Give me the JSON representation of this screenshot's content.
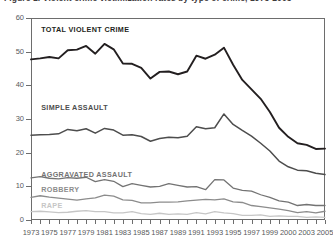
{
  "chart_data": {
    "type": "line",
    "title": "Figure 1. Violent crime victimization rates by type of crime, 1973-2005",
    "xlabel": "",
    "ylabel": "",
    "ylim": [
      0,
      60
    ],
    "yticks": [
      0,
      10,
      20,
      30,
      40,
      50,
      60
    ],
    "xlim": [
      1973,
      2005
    ],
    "grid": false,
    "legend_position": "in-plot-labels",
    "x": [
      1973,
      1974,
      1975,
      1976,
      1977,
      1978,
      1979,
      1980,
      1981,
      1982,
      1983,
      1984,
      1985,
      1986,
      1987,
      1988,
      1989,
      1990,
      1991,
      1992,
      1993,
      1994,
      1995,
      1996,
      1997,
      1998,
      1999,
      2000,
      2001,
      2002,
      2003,
      2004,
      2005
    ],
    "xtick_labels": [
      "1973",
      "1975",
      "1977",
      "1979",
      "1981",
      "1983",
      "1985",
      "1987",
      "1989",
      "1991",
      "1993",
      "1995",
      "1997",
      "1999",
      "2000",
      "2003",
      "2005"
    ],
    "xtick_values": [
      1973,
      1975,
      1977,
      1979,
      1981,
      1983,
      1985,
      1987,
      1989,
      1991,
      1993,
      1995,
      1997,
      1999,
      2001,
      2003,
      2005
    ],
    "series": [
      {
        "name": "TOTAL VIOLENT CRIME",
        "color": "#231f20",
        "width": 1.9,
        "label_x": 1974.0,
        "label_y": 56.5,
        "values": [
          47.7,
          48.0,
          48.4,
          48.0,
          50.4,
          50.6,
          51.7,
          49.4,
          52.3,
          50.7,
          46.5,
          46.4,
          45.2,
          42.0,
          44.0,
          44.1,
          43.3,
          44.1,
          48.8,
          47.9,
          49.1,
          51.2,
          46.1,
          41.6,
          38.8,
          36.0,
          32.1,
          27.4,
          24.7,
          22.8,
          22.3,
          21.1,
          21.2
        ]
      },
      {
        "name": "SIMPLE ASSAULT",
        "color": "#4d4d4d",
        "width": 1.5,
        "label_x": 1974.0,
        "label_y": 33.4,
        "values": [
          25.2,
          25.3,
          25.4,
          25.6,
          26.9,
          26.5,
          27.1,
          25.8,
          27.2,
          26.7,
          25.2,
          25.3,
          24.8,
          23.4,
          24.2,
          24.6,
          24.4,
          24.9,
          27.7,
          27.1,
          27.4,
          31.5,
          28.4,
          26.6,
          24.9,
          22.8,
          20.5,
          17.5,
          15.8,
          14.8,
          14.6,
          13.9,
          13.5
        ]
      },
      {
        "name": "AGGRAVATED ASSAULT",
        "color": "#737373",
        "width": 1.3,
        "label_x": 1974.0,
        "label_y": 13.4,
        "values": [
          12.5,
          12.9,
          12.4,
          12.2,
          12.6,
          12.4,
          12.7,
          11.4,
          12.0,
          11.5,
          9.9,
          10.8,
          10.3,
          9.8,
          10.0,
          10.8,
          10.3,
          9.8,
          9.9,
          9.0,
          12.0,
          11.9,
          9.5,
          8.8,
          8.6,
          7.5,
          6.7,
          5.7,
          5.3,
          4.3,
          4.6,
          4.3,
          4.3
        ]
      },
      {
        "name": "ROBBERY",
        "color": "#8c8c8c",
        "width": 1.3,
        "label_x": 1974.0,
        "label_y": 9.0,
        "values": [
          6.7,
          7.2,
          6.8,
          6.5,
          6.2,
          5.9,
          6.3,
          6.6,
          7.4,
          7.1,
          6.0,
          5.8,
          5.1,
          5.1,
          5.3,
          5.3,
          5.4,
          5.7,
          5.9,
          6.1,
          6.0,
          6.3,
          5.4,
          5.2,
          4.3,
          4.0,
          3.6,
          3.2,
          2.8,
          2.2,
          2.5,
          2.1,
          2.6
        ]
      },
      {
        "name": "RAPE",
        "color": "#c6c6c6",
        "width": 1.3,
        "label_x": 1974.0,
        "label_y": 4.2,
        "values": [
          2.5,
          2.6,
          2.4,
          2.2,
          2.3,
          2.6,
          2.8,
          2.5,
          2.5,
          2.1,
          2.1,
          2.5,
          1.9,
          1.7,
          2.0,
          1.7,
          1.8,
          1.7,
          2.2,
          1.8,
          2.5,
          2.1,
          1.9,
          1.4,
          1.4,
          1.5,
          1.1,
          1.2,
          1.1,
          1.1,
          0.8,
          0.9,
          0.8
        ]
      }
    ]
  }
}
